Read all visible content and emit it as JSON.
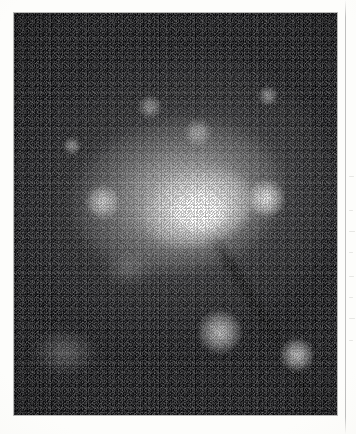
{
  "figure": {
    "kind": "astronomical-plate",
    "medium": "scanned halftone print",
    "colorspace": "grayscale",
    "frame": {
      "x": 14,
      "y": 13,
      "width": 323,
      "height": 402
    },
    "page_background": "#fdfdfb",
    "plate_background": "#07070a",
    "highlight_color": "#ffffff"
  },
  "plate": {
    "nucleus": {
      "label": "galaxy-nucleus",
      "center_x": 191,
      "center_y": 199,
      "peak_brightness": "saturated-white"
    },
    "halo": {
      "label": "galaxy-halo",
      "center_x": 175,
      "center_y": 196,
      "major_axis": 330,
      "minor_axis": 290,
      "position_angle_deg": -8,
      "description": "smooth elongated diffuse envelope fading into background noise"
    },
    "point_sources": [
      {
        "name": "source-a",
        "x": 150,
        "y": 107,
        "size": 9,
        "brightness": "faint"
      },
      {
        "name": "source-b",
        "x": 198,
        "y": 133,
        "size": 11,
        "brightness": "faint"
      },
      {
        "name": "source-c",
        "x": 103,
        "y": 202,
        "size": 14,
        "brightness": "moderate"
      },
      {
        "name": "source-d",
        "x": 265,
        "y": 198,
        "size": 15,
        "brightness": "bright"
      },
      {
        "name": "source-e",
        "x": 220,
        "y": 332,
        "size": 17,
        "brightness": "moderate"
      },
      {
        "name": "source-f",
        "x": 297,
        "y": 355,
        "size": 13,
        "brightness": "moderate"
      },
      {
        "name": "source-g",
        "x": 268,
        "y": 96,
        "size": 8,
        "brightness": "faint"
      },
      {
        "name": "source-h",
        "x": 72,
        "y": 146,
        "size": 7,
        "brightness": "faint"
      }
    ],
    "diffuse_blobs": [
      {
        "name": "companion-blob",
        "x": 65,
        "y": 352,
        "width": 58,
        "height": 40
      },
      {
        "name": "halo-knot",
        "x": 128,
        "y": 268,
        "width": 46,
        "height": 32
      }
    ],
    "dust_lanes": [
      {
        "name": "diagonal-dust-lane",
        "x": 252,
        "y": 300,
        "length": 150,
        "thickness": 9,
        "angle_deg": 58
      },
      {
        "name": "dust-lane-lower",
        "x": 300,
        "y": 382,
        "length": 70,
        "thickness": 7,
        "angle_deg": 62
      }
    ]
  },
  "scan_artifacts": {
    "column_rule": {
      "name": "adjacent-column-rule",
      "x": 345,
      "top": 0,
      "height": 434
    },
    "bleed_marks": [
      {
        "x": 349,
        "y": 176,
        "width": 5,
        "height": 1
      },
      {
        "x": 349,
        "y": 210,
        "width": 4,
        "height": 1
      },
      {
        "x": 349,
        "y": 231,
        "width": 6,
        "height": 1
      },
      {
        "x": 349,
        "y": 252,
        "width": 4,
        "height": 1
      },
      {
        "x": 349,
        "y": 276,
        "width": 5,
        "height": 1
      },
      {
        "x": 349,
        "y": 297,
        "width": 4,
        "height": 1
      },
      {
        "x": 349,
        "y": 318,
        "width": 6,
        "height": 1
      },
      {
        "x": 349,
        "y": 340,
        "width": 4,
        "height": 1
      }
    ]
  }
}
